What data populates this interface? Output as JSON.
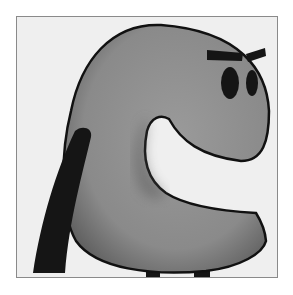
{
  "illustration": {
    "subject": "C-shaped cartoon creature",
    "colors": {
      "background": "#ffffff",
      "frame_fill": "#efefef",
      "frame_border": "#8a8a8a",
      "body_fill": "#8c8c8c",
      "body_shadow": "#5a5a5a",
      "outline": "#111111",
      "features": "#151515"
    },
    "parts": {
      "body": "body",
      "eyes": [
        "left-eye",
        "right-eye"
      ],
      "brows": [
        "left-brow",
        "right-brow"
      ],
      "tail": "tail",
      "feet": [
        "left-foot",
        "right-foot"
      ]
    }
  }
}
